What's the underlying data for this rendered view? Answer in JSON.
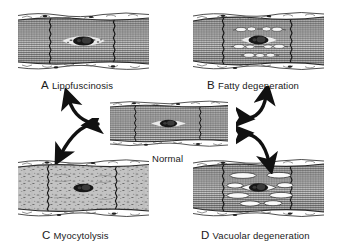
{
  "figure": {
    "background_color": "#ffffff",
    "ink_color": "#1a1a1a"
  },
  "panels": [
    {
      "id": "panel-a",
      "letter": "A",
      "name": "Lipofuscinosis",
      "position": "top-left",
      "x": 18,
      "y": 11,
      "w": 131,
      "h": 60,
      "label_x": 41,
      "label_y": 76,
      "features": {
        "striations": "intact",
        "nucleus": "central dark ellipse with pale perinuclear halo",
        "inclusion": "perinuclear golden-brown lipofuscin granules",
        "vacuoles": "none"
      }
    },
    {
      "id": "panel-b",
      "letter": "B",
      "name": "Fatty degeneration",
      "position": "top-right",
      "x": 193,
      "y": 11,
      "w": 131,
      "h": 60,
      "label_x": 207,
      "label_y": 76,
      "features": {
        "striations": "intact between droplet rows",
        "nucleus": "central dark ellipse",
        "inclusion": "rows of small elongated fat droplets",
        "vacuoles": "many small, chain-like, in longitudinal rows"
      }
    },
    {
      "id": "panel-c",
      "letter": "C",
      "name": "Myocytolysis",
      "position": "bottom-left",
      "x": 18,
      "y": 158,
      "w": 131,
      "h": 60,
      "label_x": 42,
      "label_y": 226,
      "features": {
        "striations": "lost, replaced by mottled stippled cytoplasm",
        "nucleus": "central dark ellipse",
        "inclusion": "granular debris",
        "vacuoles": "none discrete"
      }
    },
    {
      "id": "panel-d",
      "letter": "D",
      "name": "Vacuolar degeneration",
      "position": "bottom-right",
      "x": 193,
      "y": 158,
      "w": 131,
      "h": 60,
      "label_x": 201,
      "label_y": 226,
      "features": {
        "striations": "displaced by vacuoles",
        "nucleus": "central dark ellipse",
        "inclusion": "none",
        "vacuoles": "large elongated clear vacuoles"
      }
    }
  ],
  "center": {
    "id": "panel-normal",
    "letter": "",
    "name": "Normal",
    "x": 110,
    "y": 100,
    "w": 118,
    "h": 48,
    "label_x": 152,
    "label_y": 154,
    "features": {
      "striations": "regular cross-striations throughout",
      "nucleus": "central dark ellipse with pale halo",
      "intercalated_discs": "two vertical zigzag lines",
      "vacuoles": "none"
    }
  },
  "arrows": [
    {
      "id": "arrow-normal-to-a",
      "from": "Normal",
      "to": "A Lipofuscinosis",
      "heads": "single",
      "direction": "up-left"
    },
    {
      "id": "arrow-normal-to-b",
      "from": "Normal",
      "to": "B Fatty degeneration",
      "heads": "double",
      "direction": "up-right"
    },
    {
      "id": "arrow-normal-to-c",
      "from": "Normal",
      "to": "C Myocytolysis",
      "heads": "double",
      "direction": "down-left"
    },
    {
      "id": "arrow-normal-to-d",
      "from": "Normal",
      "to": "D Vacuolar degeneration",
      "heads": "double",
      "direction": "down-right"
    }
  ]
}
